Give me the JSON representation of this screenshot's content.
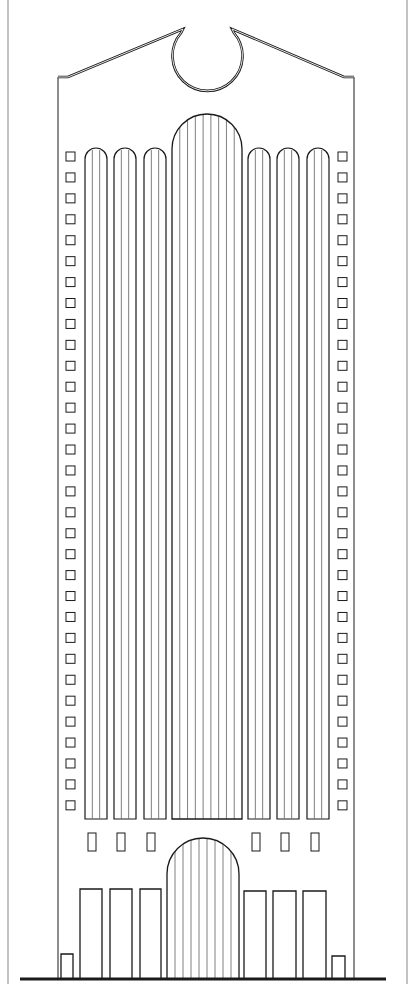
{
  "drawing": {
    "title": "",
    "background": "#ffffff",
    "ink": "#1a1a1a",
    "frame_color": "#9a9a9a",
    "stripe_color": "#6f6f6f",
    "frame": {
      "left_x": 8,
      "right_x": 407
    },
    "ground": {
      "y": 979,
      "x1": 20,
      "x2": 386,
      "thickness": 3
    },
    "facade": {
      "left_x": 58,
      "right_x": 354,
      "eave_y": 77,
      "bottom_y": 979
    },
    "pediment": {
      "left_peak": [
        183,
        29
      ],
      "right_peak": [
        232,
        29
      ],
      "notch_center": [
        207,
        50
      ],
      "notch_radius": 35
    },
    "side_squares": {
      "left_x": 66,
      "right_x": 338,
      "size": 9,
      "start_y": 152,
      "step": 20.93,
      "count": 32
    },
    "bays": {
      "top_y": 148,
      "bottom_y": 819,
      "arch_radius": 11,
      "items": [
        {
          "x": 85,
          "w": 22
        },
        {
          "x": 114,
          "w": 22
        },
        {
          "x": 144,
          "w": 22
        },
        {
          "x": 248,
          "w": 22
        },
        {
          "x": 277,
          "w": 22
        },
        {
          "x": 307,
          "w": 22
        }
      ],
      "inner_lines": 2
    },
    "central_shaft": {
      "x": 172,
      "w": 70,
      "top_y": 114,
      "bottom_y": 819,
      "stripes": 8
    },
    "mezzanine_windows": {
      "y": 833,
      "h": 18,
      "w": 8,
      "xs": [
        88,
        117,
        147,
        252,
        281,
        311
      ]
    },
    "entrance_arch": {
      "x": 167,
      "w": 72,
      "top_y": 838,
      "bottom_y": 979,
      "stripes": 8
    },
    "base_doors": {
      "items": [
        {
          "x": 80,
          "y": 889,
          "w": 22
        },
        {
          "x": 110,
          "y": 889,
          "w": 22
        },
        {
          "x": 140,
          "y": 889,
          "w": 21
        },
        {
          "x": 244,
          "y": 891,
          "w": 22
        },
        {
          "x": 273,
          "y": 891,
          "w": 23
        },
        {
          "x": 303,
          "y": 891,
          "w": 23
        }
      ]
    },
    "small_doors": {
      "items": [
        {
          "x": 61,
          "y": 954,
          "w": 12
        },
        {
          "x": 332,
          "y": 956,
          "w": 13
        }
      ]
    }
  }
}
